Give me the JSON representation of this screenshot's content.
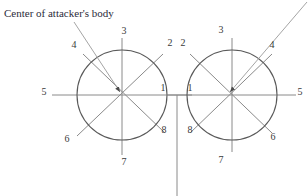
{
  "figure": {
    "background_color": "#ffffff",
    "line_color": "#8a8a8a",
    "circle_color": "#595959",
    "text_color": "#3a3a3a",
    "caption_color": "#2b2b3a",
    "caption": "Center of attacker's body"
  },
  "left_circle": {
    "name": "left-octagon-circle",
    "cx": 122,
    "cy": 95,
    "r": 45,
    "directions": [
      {
        "number": "1",
        "angle_deg": 0,
        "label_x": 163,
        "label_y": 88
      },
      {
        "number": "2",
        "angle_deg": 315,
        "label_x": 170,
        "label_y": 43
      },
      {
        "number": "3",
        "angle_deg": 270,
        "label_x": 124,
        "label_y": 31
      },
      {
        "number": "4",
        "angle_deg": 225,
        "label_x": 74,
        "label_y": 45
      },
      {
        "number": "5",
        "angle_deg": 180,
        "label_x": 44,
        "label_y": 92
      },
      {
        "number": "6",
        "angle_deg": 135,
        "label_x": 67,
        "label_y": 139
      },
      {
        "number": "7",
        "angle_deg": 90,
        "label_x": 124,
        "label_y": 162
      },
      {
        "number": "8",
        "angle_deg": 45,
        "label_x": 164,
        "label_y": 130
      }
    ]
  },
  "right_circle": {
    "name": "right-octagon-circle",
    "cx": 232,
    "cy": 95,
    "r": 45,
    "directions": [
      {
        "number": "1",
        "angle_deg": 180,
        "label_x": 190,
        "label_y": 88
      },
      {
        "number": "2",
        "angle_deg": 225,
        "label_x": 183,
        "label_y": 43
      },
      {
        "number": "3",
        "angle_deg": 270,
        "label_x": 221,
        "label_y": 30
      },
      {
        "number": "4",
        "angle_deg": 315,
        "label_x": 272,
        "label_y": 45
      },
      {
        "number": "5",
        "angle_deg": 0,
        "label_x": 300,
        "label_y": 92
      },
      {
        "number": "6",
        "angle_deg": 45,
        "label_x": 273,
        "label_y": 137
      },
      {
        "number": "7",
        "angle_deg": 90,
        "label_x": 221,
        "label_y": 160
      },
      {
        "number": "8",
        "angle_deg": 135,
        "label_x": 190,
        "label_y": 130
      }
    ]
  },
  "tangent_point": {
    "x": 177,
    "y": 95
  },
  "caption_position": {
    "x": 4,
    "y": 8
  }
}
